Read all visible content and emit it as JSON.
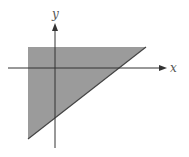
{
  "diagram": {
    "type": "shaded-region",
    "axes": {
      "x_label": "x",
      "y_label": "y",
      "color": "#333333"
    },
    "region": {
      "shape": "triangle",
      "fill": "#9b9b9b",
      "edge": "#444444",
      "vertices_px": [
        [
          28,
          47
        ],
        [
          146,
          47
        ],
        [
          28,
          139
        ]
      ]
    }
  }
}
